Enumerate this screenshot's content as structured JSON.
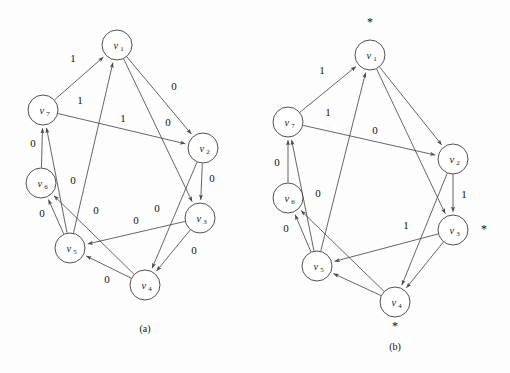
{
  "figure": {
    "background_color": "#fdfdfd",
    "stroke_color": "#4a4a4a",
    "text_color": "#111111"
  },
  "panels": [
    {
      "id": "panel-a",
      "caption": "(a)",
      "caption_x": 145,
      "caption_y": 332,
      "nodes": [
        {
          "id": "v1",
          "base": "v",
          "sub": "1",
          "cx": 117,
          "cy": 45,
          "r": 15,
          "star": null
        },
        {
          "id": "v2",
          "base": "v",
          "sub": "2",
          "cx": 203,
          "cy": 148,
          "r": 15,
          "star": null
        },
        {
          "id": "v3",
          "base": "v",
          "sub": "3",
          "cx": 200,
          "cy": 218,
          "r": 15,
          "star": null
        },
        {
          "id": "v4",
          "base": "v",
          "sub": "4",
          "cx": 145,
          "cy": 285,
          "r": 15,
          "star": null
        },
        {
          "id": "v5",
          "base": "v",
          "sub": "5",
          "cx": 70,
          "cy": 248,
          "r": 15,
          "star": null
        },
        {
          "id": "v6",
          "base": "v",
          "sub": "6",
          "cx": 41,
          "cy": 183,
          "r": 15,
          "star": null
        },
        {
          "id": "v7",
          "base": "v",
          "sub": "7",
          "cx": 43,
          "cy": 110,
          "r": 15,
          "star": null
        }
      ],
      "edges": [
        {
          "from": "v7",
          "to": "v1",
          "label": "1",
          "lx": 73,
          "ly": 62
        },
        {
          "from": "v5",
          "to": "v1",
          "label": "1",
          "lx": 80,
          "ly": 104
        },
        {
          "from": "v7",
          "to": "v2",
          "label": "1",
          "lx": 123,
          "ly": 122
        },
        {
          "from": "v1",
          "to": "v2",
          "label": "0",
          "lx": 174,
          "ly": 90
        },
        {
          "from": "v1",
          "to": "v3",
          "label": "0",
          "lx": 168,
          "ly": 126
        },
        {
          "from": "v2",
          "to": "v3",
          "label": "0",
          "lx": 212,
          "ly": 182
        },
        {
          "from": "v3",
          "to": "v4",
          "label": "0",
          "lx": 194,
          "ly": 254
        },
        {
          "from": "v2",
          "to": "v4",
          "label": "0",
          "lx": 157,
          "ly": 212
        },
        {
          "from": "v3",
          "to": "v5",
          "label": "0",
          "lx": 136,
          "ly": 224
        },
        {
          "from": "v4",
          "to": "v5",
          "label": "0",
          "lx": 107,
          "ly": 283
        },
        {
          "from": "v4",
          "to": "v6",
          "label": "0",
          "lx": 96,
          "ly": 214
        },
        {
          "from": "v5",
          "to": "v6",
          "label": "0",
          "lx": 42,
          "ly": 217
        },
        {
          "from": "v6",
          "to": "v7",
          "label": "0",
          "lx": 33,
          "ly": 147
        },
        {
          "from": "v5",
          "to": "v7",
          "label": "0",
          "lx": 73,
          "ly": 184
        }
      ]
    },
    {
      "id": "panel-b",
      "caption": "(b)",
      "caption_x": 395,
      "caption_y": 350,
      "nodes": [
        {
          "id": "v1",
          "base": "v",
          "sub": "1",
          "cx": 370,
          "cy": 55,
          "r": 15,
          "star": {
            "x": 370,
            "y": 26
          }
        },
        {
          "id": "v2",
          "base": "v",
          "sub": "2",
          "cx": 453,
          "cy": 159,
          "r": 15,
          "star": null
        },
        {
          "id": "v3",
          "base": "v",
          "sub": "3",
          "cx": 453,
          "cy": 230,
          "r": 15,
          "star": {
            "x": 484,
            "y": 233
          }
        },
        {
          "id": "v4",
          "base": "v",
          "sub": "4",
          "cx": 395,
          "cy": 302,
          "r": 15,
          "star": {
            "x": 395,
            "y": 330
          }
        },
        {
          "id": "v5",
          "base": "v",
          "sub": "5",
          "cx": 317,
          "cy": 266,
          "r": 15,
          "star": null
        },
        {
          "id": "v6",
          "base": "v",
          "sub": "6",
          "cx": 288,
          "cy": 198,
          "r": 15,
          "star": null
        },
        {
          "id": "v7",
          "base": "v",
          "sub": "7",
          "cx": 288,
          "cy": 122,
          "r": 15,
          "star": null
        }
      ],
      "edges": [
        {
          "from": "v7",
          "to": "v1",
          "label": "1",
          "lx": 322,
          "ly": 74
        },
        {
          "from": "v5",
          "to": "v1",
          "label": "1",
          "lx": 328,
          "ly": 116
        },
        {
          "from": "v7",
          "to": "v2",
          "label": "0",
          "lx": 375,
          "ly": 134
        },
        {
          "from": "v1",
          "to": "v2",
          "label": "",
          "lx": 0,
          "ly": 0
        },
        {
          "from": "v1",
          "to": "v3",
          "label": "",
          "lx": 0,
          "ly": 0
        },
        {
          "from": "v2",
          "to": "v3",
          "label": "1",
          "lx": 464,
          "ly": 198
        },
        {
          "from": "v3",
          "to": "v4",
          "label": "",
          "lx": 0,
          "ly": 0
        },
        {
          "from": "v2",
          "to": "v4",
          "label": "1",
          "lx": 406,
          "ly": 229
        },
        {
          "from": "v3",
          "to": "v5",
          "label": "",
          "lx": 0,
          "ly": 0
        },
        {
          "from": "v4",
          "to": "v5",
          "label": "",
          "lx": 0,
          "ly": 0
        },
        {
          "from": "v4",
          "to": "v6",
          "label": "0",
          "lx": 318,
          "ly": 197
        },
        {
          "from": "v5",
          "to": "v6",
          "label": "0",
          "lx": 286,
          "ly": 232
        },
        {
          "from": "v6",
          "to": "v7",
          "label": "0",
          "lx": 277,
          "ly": 166
        },
        {
          "from": "v5",
          "to": "v7",
          "label": "",
          "lx": 0,
          "ly": 0
        }
      ]
    }
  ],
  "symbols": {
    "star": "*",
    "arrowhead": "arrowhead-icon"
  }
}
